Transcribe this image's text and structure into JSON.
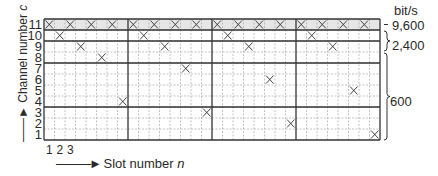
{
  "axes": {
    "y_label": "Channel number",
    "y_var": "c",
    "x_label": "Slot number",
    "x_var": "n",
    "row_labels": [
      "11",
      "10",
      "9",
      "8",
      "7",
      "6",
      "5",
      "4",
      "3",
      "2",
      "1"
    ],
    "col_labels": [
      "1",
      "2",
      "3"
    ]
  },
  "grid": {
    "slots": 32,
    "channels": 11,
    "thick_vertical_every": 8,
    "thick_horizontal_after_rows": [
      11,
      10,
      8,
      4
    ]
  },
  "marks": {
    "11": [
      1,
      3,
      5,
      7,
      9,
      11,
      13,
      15,
      17,
      19,
      21,
      23,
      25,
      27,
      29,
      31
    ],
    "10": [
      2,
      10,
      18,
      26
    ],
    "9": [
      4,
      12,
      20,
      28
    ],
    "8": [
      6
    ],
    "7": [
      14
    ],
    "6": [
      22
    ],
    "5": [
      30
    ],
    "4": [
      8
    ],
    "3": [
      16
    ],
    "2": [
      24
    ],
    "1": [
      32
    ]
  },
  "rates": {
    "unit": "bit/s",
    "groups": [
      {
        "label": "9,600",
        "channels": "11"
      },
      {
        "label": "2,400",
        "channels": "9-10"
      },
      {
        "label": "600",
        "channels": "1-8"
      }
    ]
  },
  "colors": {
    "line": "#333333",
    "thin_line": "#9a9a9a",
    "header_fill": "#e6e6e6"
  }
}
